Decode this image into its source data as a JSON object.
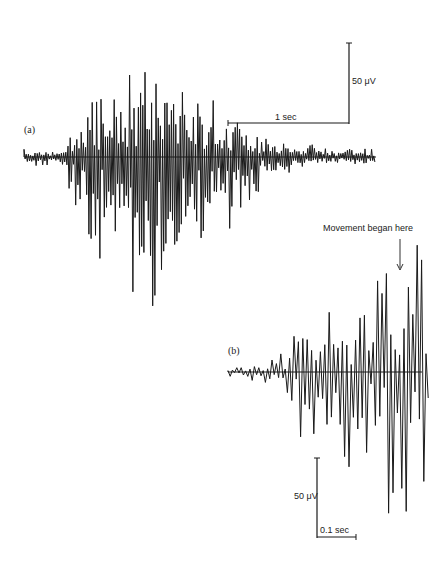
{
  "figure": {
    "panel_a_label": "(a)",
    "panel_b_label": "(b)",
    "annotation": "Movement began here",
    "scale_a": {
      "voltage": "50 μV",
      "time": "1 sec"
    },
    "scale_b": {
      "voltage": "50 μV",
      "time": "0.1 sec"
    },
    "colors": {
      "trace": "#1a1a1a",
      "background": "#ffffff"
    }
  },
  "chart_data": [
    {
      "type": "line",
      "title": "(a)",
      "description": "EMG burst recorded over ~3 sec; low-amplitude baseline rising to large spikes in the middle then decaying",
      "xlabel": "time",
      "ylabel": "potential",
      "scale_bars": {
        "y": "50 μV",
        "x": "1 sec"
      },
      "baseline_y_px": 157,
      "x_range_px": [
        24,
        376
      ],
      "envelope": {
        "x": [
          24,
          60,
          80,
          100,
          120,
          140,
          150,
          160,
          180,
          200,
          220,
          240,
          260,
          280,
          300,
          320,
          340,
          376
        ],
        "upper_amp": [
          8,
          10,
          40,
          65,
          85,
          100,
          95,
          130,
          95,
          80,
          60,
          45,
          30,
          20,
          15,
          12,
          10,
          8
        ],
        "lower_amp": [
          10,
          12,
          60,
          105,
          145,
          150,
          140,
          190,
          150,
          120,
          85,
          60,
          35,
          22,
          15,
          12,
          10,
          8
        ]
      }
    },
    {
      "type": "line",
      "title": "(b)",
      "description": "Expanded trace near movement onset; quiet baseline then growing oscillations with very large spikes at right",
      "xlabel": "time",
      "ylabel": "potential",
      "scale_bars": {
        "y": "50 μV",
        "x": "0.1 sec"
      },
      "annotation": "Movement began here",
      "baseline_y_px": 372,
      "x_range_px": [
        228,
        430
      ],
      "envelope": {
        "x": [
          228,
          260,
          280,
          300,
          320,
          340,
          360,
          380,
          400,
          410,
          420,
          430
        ],
        "upper_amp": [
          4,
          8,
          20,
          50,
          40,
          85,
          60,
          125,
          90,
          140,
          210,
          40
        ],
        "lower_amp": [
          5,
          10,
          30,
          80,
          90,
          120,
          110,
          115,
          180,
          120,
          195,
          40
        ]
      }
    }
  ]
}
